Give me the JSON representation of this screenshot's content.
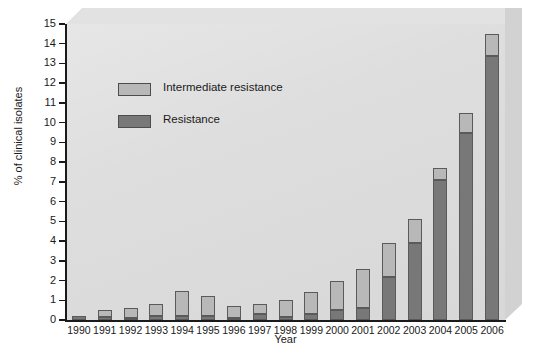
{
  "chart_data": {
    "type": "bar",
    "subtype": "stacked",
    "title": "",
    "xlabel": "Year",
    "ylabel": "% of clinical isolates",
    "ylim": [
      0,
      15
    ],
    "ytick_labels": [
      "0",
      "1",
      "2",
      "3",
      "4",
      "5",
      "6",
      "7",
      "8",
      "9",
      "10",
      "11",
      "12",
      "13",
      "14",
      "15"
    ],
    "ytick_values": [
      0,
      1,
      2,
      3,
      4,
      5,
      6,
      7,
      8,
      9,
      10,
      11,
      12,
      13,
      14,
      15
    ],
    "grid": false,
    "legend_position": "upper-left-inside",
    "categories": [
      "1990",
      "1991",
      "1992",
      "1993",
      "1994",
      "1995",
      "1996",
      "1997",
      "1998",
      "1999",
      "2000",
      "2001",
      "2002",
      "2003",
      "2004",
      "2005",
      "2006"
    ],
    "series": [
      {
        "name": "Resistance",
        "color": "#787878",
        "values": [
          0.2,
          0.15,
          0.1,
          0.2,
          0.2,
          0.2,
          0.1,
          0.3,
          0.15,
          0.3,
          0.5,
          0.6,
          2.2,
          3.9,
          7.1,
          9.5,
          13.4
        ]
      },
      {
        "name": "Intermediate resistance",
        "color": "#b8b8b8",
        "values": [
          0.0,
          0.35,
          0.5,
          0.6,
          1.25,
          1.0,
          0.6,
          0.5,
          0.85,
          1.1,
          1.5,
          2.0,
          1.7,
          1.2,
          0.6,
          1.0,
          1.1
        ]
      }
    ],
    "totals": [
      0.2,
      0.5,
      0.6,
      0.8,
      1.45,
      1.2,
      0.7,
      0.8,
      1.0,
      1.4,
      2.0,
      2.6,
      3.9,
      5.1,
      7.7,
      10.5,
      14.5
    ]
  },
  "legend": {
    "items": [
      {
        "label": "Intermediate resistance",
        "color": "#b8b8b8"
      },
      {
        "label": "Resistance",
        "color": "#787878"
      }
    ]
  },
  "colors": {
    "plot_background": "#dcdcdc",
    "panel_top_bevel": "#e2e2e2",
    "panel_right_bevel": "#d2d2d2",
    "axis": "#1a1a1a",
    "bar_border": "#5a5a5a"
  }
}
